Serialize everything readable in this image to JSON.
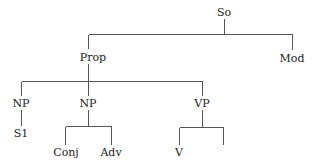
{
  "diagram": {
    "type": "syntax-tree",
    "root": "So",
    "nodes": {
      "so": {
        "label": "So",
        "x": 224,
        "y": 12
      },
      "prop": {
        "label": "Prop",
        "x": 93,
        "y": 57
      },
      "mod": {
        "label": "Mod",
        "x": 292,
        "y": 58
      },
      "np1": {
        "label": "NP",
        "x": 21,
        "y": 103
      },
      "np2": {
        "label": "NP",
        "x": 88,
        "y": 103
      },
      "vp": {
        "label": "VP",
        "x": 202,
        "y": 103
      },
      "s1": {
        "label": "S1",
        "x": 21,
        "y": 133
      },
      "conj": {
        "label": "Conj",
        "x": 66,
        "y": 152
      },
      "adv": {
        "label": "Adv",
        "x": 111,
        "y": 152
      },
      "v": {
        "label": "V",
        "x": 179,
        "y": 152
      },
      "empty_leaf": {
        "label": "",
        "x": 223,
        "y": 152
      }
    },
    "edges": [
      [
        "So",
        "Prop"
      ],
      [
        "So",
        "Mod"
      ],
      [
        "Prop",
        "NP"
      ],
      [
        "Prop",
        "NP"
      ],
      [
        "Prop",
        "VP"
      ],
      [
        "NP",
        "S1"
      ],
      [
        "NP",
        "Conj"
      ],
      [
        "NP",
        "Adv"
      ],
      [
        "VP",
        "V"
      ],
      [
        "VP",
        "(empty)"
      ]
    ],
    "line_color": "#555555",
    "text_color": "#222222"
  }
}
